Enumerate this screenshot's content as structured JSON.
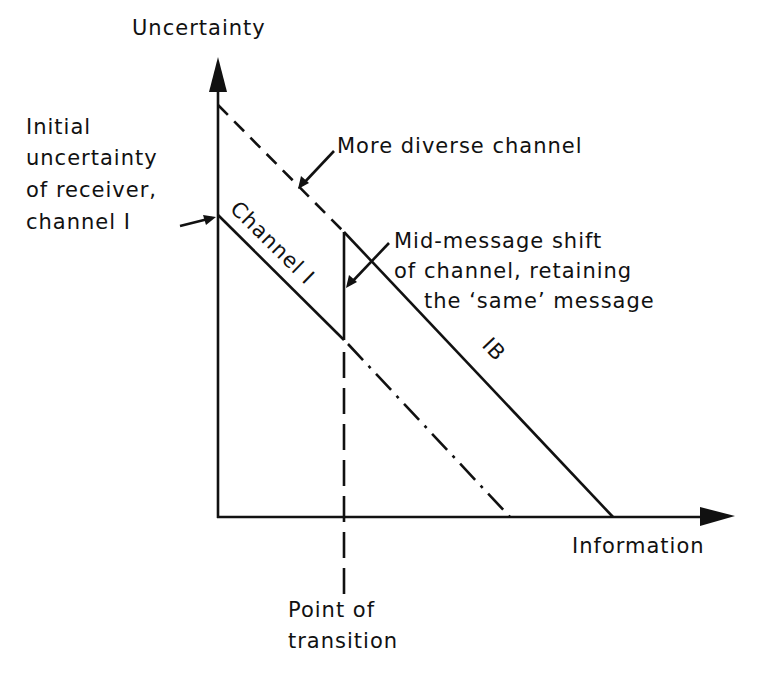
{
  "diagram": {
    "axes": {
      "y_label": "Uncertainty",
      "x_label": "Information"
    },
    "annotations": {
      "initial": [
        "Initial",
        "uncertainty",
        "of receiver,",
        "channel I"
      ],
      "more_diverse": "More diverse channel",
      "mid_message": [
        "Mid-message shift",
        "of channel, retaining",
        "the ‘same’ message"
      ],
      "transition": [
        "Point of",
        "transition"
      ]
    },
    "line_labels": {
      "channel_one": "Channel I",
      "ib": "IB"
    },
    "colors": {
      "ink": "#111111",
      "background": "#ffffff"
    }
  }
}
